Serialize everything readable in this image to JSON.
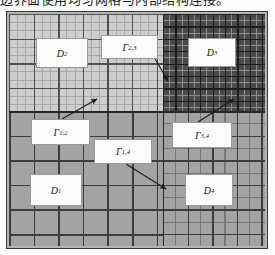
{
  "caption": {
    "text": "边界面使用均匀网格与内部结构连接。"
  },
  "figure": {
    "type": "domain-decomposition-mesh-diagram",
    "frame_color": "#3a3a3a",
    "quadrants": [
      {
        "id": "D2",
        "label": "D",
        "subscript": "2",
        "position": "top-left",
        "background": "#cdcdcd",
        "mesh": "fine-uniform-with-coarse-overlay",
        "description": "light shaded subdomain with fine uniform mesh"
      },
      {
        "id": "D3",
        "label": "D",
        "subscript": "3",
        "position": "top-right",
        "background": "#4a4a4a",
        "mesh": "very-fine-uniform",
        "description": "dark shaded subdomain with very fine uniform mesh"
      },
      {
        "id": "D1",
        "label": "D",
        "subscript": "1",
        "position": "bottom-left",
        "background": "#a3a3a3",
        "mesh": "coarse-uniform",
        "description": "mid-gray subdomain with coarse mesh"
      },
      {
        "id": "D4",
        "label": "D",
        "subscript": "4",
        "position": "bottom-right",
        "background": "#a3a3a3",
        "mesh": "medium-uniform",
        "description": "mid-gray subdomain with medium mesh"
      }
    ],
    "interfaces": [
      {
        "id": "G23",
        "label": "Γ",
        "subscript": "2,3",
        "between": [
          "D2",
          "D3"
        ],
        "callout_from": [
          158,
          47
        ],
        "callout_to": [
          166,
          80
        ]
      },
      {
        "id": "G12",
        "label": "Γ",
        "subscript": "1,2",
        "between": [
          "D1",
          "D2"
        ],
        "callout_from": [
          62,
          119
        ],
        "callout_to": [
          96,
          99
        ]
      },
      {
        "id": "G14",
        "label": "Γ",
        "subscript": "1,4",
        "between": [
          "D1",
          "D4"
        ],
        "callout_from": [
          124,
          164
        ],
        "callout_to": [
          165,
          188
        ]
      },
      {
        "id": "G34",
        "label": "Γ",
        "subscript": "3,4",
        "between": [
          "D3",
          "D4"
        ],
        "callout_from": [
          196,
          122
        ],
        "callout_to": [
          233,
          99
        ]
      }
    ],
    "arrow_color": "#1b1b1b",
    "label_box_fill": "#fbfbfb",
    "label_box_border": "#9a9a9a"
  }
}
